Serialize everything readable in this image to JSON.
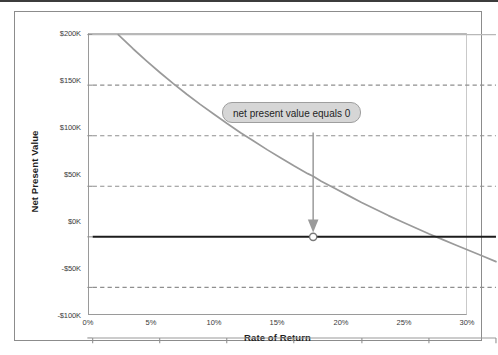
{
  "chart_data": {
    "type": "line",
    "title": "",
    "xlabel": "Rate of Return",
    "ylabel": "Net Present Value",
    "xlim": [
      0,
      30
    ],
    "ylim": [
      -100000,
      200000
    ],
    "xticklabels": [
      "0%",
      "5%",
      "10%",
      "15%",
      "20%",
      "25%",
      "30%"
    ],
    "xtickvalues": [
      0,
      5,
      10,
      15,
      20,
      25,
      30
    ],
    "yticklabels": [
      "$200K",
      "$150K",
      "$100K",
      "$50K",
      "$0K",
      "-$50K",
      "-$100K"
    ],
    "ytickvalues": [
      200000,
      150000,
      100000,
      50000,
      0,
      -50000,
      -100000
    ],
    "grid": "horizontal-dashed",
    "legend": "none",
    "series": [
      {
        "name": "Net Present Value",
        "color": "#9a9a9a",
        "x": [
          1.9,
          3.0,
          4.0,
          5.0,
          6.0,
          7.0,
          8.0,
          9.0,
          10.0,
          11.0,
          12.0,
          13.0,
          14.0,
          15.0,
          16.0,
          16.4,
          17.0,
          18.0,
          19.0,
          20.0,
          21.0,
          22.0,
          23.0,
          24.0,
          25.0,
          26.0,
          27.0,
          28.0,
          29.0,
          30.0
        ],
        "y": [
          200000,
          186000,
          174000,
          162500,
          151500,
          141000,
          131000,
          121500,
          112000,
          103000,
          94500,
          86000,
          78000,
          70000,
          62500,
          60000,
          55000,
          48000,
          41000,
          34000,
          27500,
          21000,
          15000,
          9000,
          3000,
          -2500,
          -8000,
          -13500,
          -19000,
          -24500
        ]
      }
    ],
    "zero_line": {
      "name": "zero-reference-line",
      "value": 0,
      "color": "#1c1c1c"
    },
    "markers": [
      {
        "name": "irr-point",
        "x": 16.4,
        "y": 0,
        "label": "net present value equals 0"
      }
    ],
    "annotations": [
      {
        "name": "npv-zero-callout",
        "text": "net present value equals 0",
        "arrow_to_x": 16.4,
        "arrow_to_y": 0,
        "fill": "#d6d6d6",
        "border": "#9e9e9e"
      }
    ]
  },
  "colors": {
    "curve": "#9a9a9a",
    "zero_line": "#1c1c1c",
    "gridline": "#8f8f8f",
    "frame": "#8c8c8c",
    "text": "#3a3a3a",
    "callout_fill": "#d6d6d6",
    "callout_border": "#9e9e9e"
  }
}
